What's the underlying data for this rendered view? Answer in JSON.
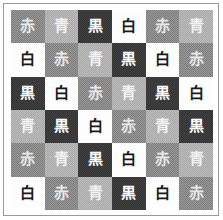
{
  "figure": {
    "name": "color-word-grid",
    "rows": 6,
    "columns": 6,
    "border_color": "#9a9a9a",
    "background_color": "#ffffff"
  },
  "legend": {
    "swatches": [
      {
        "key": "aka",
        "label": "赤",
        "meaning": "red",
        "fill": "#7c7c7c",
        "text_color": "#e8e8e8",
        "textured": true
      },
      {
        "key": "ao",
        "label": "青",
        "meaning": "blue",
        "fill": "#a9a9a9",
        "text_color": "#f2f2f2",
        "textured": true
      },
      {
        "key": "kuro",
        "label": "黒",
        "meaning": "black",
        "fill": "#333333",
        "text_color": "#ffffff",
        "textured": false
      },
      {
        "key": "shiro",
        "label": "白",
        "meaning": "white",
        "fill": "#fdfdfd",
        "text_color": "#1a1a1a",
        "textured": false
      }
    ]
  },
  "chart_data": {
    "type": "heatmap",
    "title": "",
    "xlabel": "",
    "ylabel": "",
    "categories": [
      "1",
      "2",
      "3",
      "4",
      "5",
      "6"
    ],
    "row_labels": [
      "1",
      "2",
      "3",
      "4",
      "5",
      "6"
    ],
    "legend_position": "none",
    "grid": true,
    "cells": [
      [
        {
          "label": "赤",
          "key": "aka",
          "fill": "#7c7c7c",
          "text_color": "#e8e8e8"
        },
        {
          "label": "青",
          "key": "ao",
          "fill": "#a9a9a9",
          "text_color": "#f2f2f2"
        },
        {
          "label": "黒",
          "key": "kuro",
          "fill": "#333333",
          "text_color": "#ffffff"
        },
        {
          "label": "白",
          "key": "shiro",
          "fill": "#fdfdfd",
          "text_color": "#1a1a1a"
        },
        {
          "label": "赤",
          "key": "aka",
          "fill": "#7c7c7c",
          "text_color": "#e8e8e8"
        },
        {
          "label": "青",
          "key": "ao",
          "fill": "#a9a9a9",
          "text_color": "#f2f2f2"
        }
      ],
      [
        {
          "label": "白",
          "key": "shiro",
          "fill": "#fdfdfd",
          "text_color": "#1a1a1a"
        },
        {
          "label": "赤",
          "key": "aka",
          "fill": "#7c7c7c",
          "text_color": "#e8e8e8"
        },
        {
          "label": "青",
          "key": "ao",
          "fill": "#a9a9a9",
          "text_color": "#f2f2f2"
        },
        {
          "label": "黒",
          "key": "kuro",
          "fill": "#333333",
          "text_color": "#ffffff"
        },
        {
          "label": "白",
          "key": "shiro",
          "fill": "#fdfdfd",
          "text_color": "#1a1a1a"
        },
        {
          "label": "赤",
          "key": "aka",
          "fill": "#7c7c7c",
          "text_color": "#e8e8e8"
        }
      ],
      [
        {
          "label": "黒",
          "key": "kuro",
          "fill": "#333333",
          "text_color": "#ffffff"
        },
        {
          "label": "白",
          "key": "shiro",
          "fill": "#fdfdfd",
          "text_color": "#1a1a1a"
        },
        {
          "label": "赤",
          "key": "aka",
          "fill": "#7c7c7c",
          "text_color": "#e8e8e8"
        },
        {
          "label": "青",
          "key": "ao",
          "fill": "#a9a9a9",
          "text_color": "#f2f2f2"
        },
        {
          "label": "黒",
          "key": "kuro",
          "fill": "#333333",
          "text_color": "#ffffff"
        },
        {
          "label": "白",
          "key": "shiro",
          "fill": "#fdfdfd",
          "text_color": "#1a1a1a"
        }
      ],
      [
        {
          "label": "青",
          "key": "ao",
          "fill": "#a9a9a9",
          "text_color": "#f2f2f2"
        },
        {
          "label": "黒",
          "key": "kuro",
          "fill": "#333333",
          "text_color": "#ffffff"
        },
        {
          "label": "白",
          "key": "shiro",
          "fill": "#fdfdfd",
          "text_color": "#1a1a1a"
        },
        {
          "label": "赤",
          "key": "aka",
          "fill": "#7c7c7c",
          "text_color": "#e8e8e8"
        },
        {
          "label": "青",
          "key": "ao",
          "fill": "#a9a9a9",
          "text_color": "#f2f2f2"
        },
        {
          "label": "黒",
          "key": "kuro",
          "fill": "#333333",
          "text_color": "#ffffff"
        }
      ],
      [
        {
          "label": "赤",
          "key": "aka",
          "fill": "#7c7c7c",
          "text_color": "#e8e8e8"
        },
        {
          "label": "青",
          "key": "ao",
          "fill": "#a9a9a9",
          "text_color": "#f2f2f2"
        },
        {
          "label": "黒",
          "key": "kuro",
          "fill": "#333333",
          "text_color": "#ffffff"
        },
        {
          "label": "白",
          "key": "shiro",
          "fill": "#fdfdfd",
          "text_color": "#1a1a1a"
        },
        {
          "label": "赤",
          "key": "aka",
          "fill": "#7c7c7c",
          "text_color": "#e8e8e8"
        },
        {
          "label": "青",
          "key": "ao",
          "fill": "#a9a9a9",
          "text_color": "#f2f2f2"
        }
      ],
      [
        {
          "label": "白",
          "key": "shiro",
          "fill": "#fdfdfd",
          "text_color": "#1a1a1a"
        },
        {
          "label": "赤",
          "key": "aka",
          "fill": "#7c7c7c",
          "text_color": "#e8e8e8"
        },
        {
          "label": "青",
          "key": "ao",
          "fill": "#a9a9a9",
          "text_color": "#f2f2f2"
        },
        {
          "label": "黒",
          "key": "kuro",
          "fill": "#333333",
          "text_color": "#ffffff"
        },
        {
          "label": "白",
          "key": "shiro",
          "fill": "#fdfdfd",
          "text_color": "#1a1a1a"
        },
        {
          "label": "赤",
          "key": "aka",
          "fill": "#7c7c7c",
          "text_color": "#e8e8e8"
        }
      ]
    ]
  }
}
